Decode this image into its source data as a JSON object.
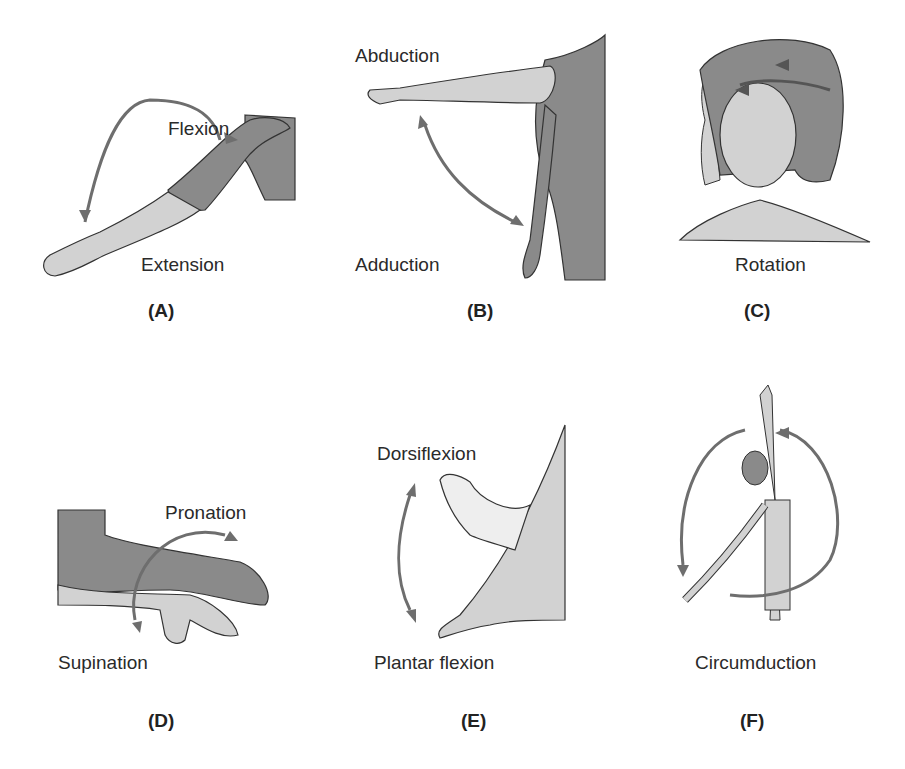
{
  "figure": {
    "colors": {
      "dark_limb": "#8a8a8a",
      "light_limb": "#d2d2d2",
      "outline": "#333333",
      "arrow": "#6e6e6e"
    },
    "panels": [
      {
        "id": "A",
        "caption": "(A)",
        "labels": [
          "Flexion",
          "Extension"
        ]
      },
      {
        "id": "B",
        "caption": "(B)",
        "labels": [
          "Abduction",
          "Adduction"
        ]
      },
      {
        "id": "C",
        "caption": "(C)",
        "labels": [
          "Rotation"
        ]
      },
      {
        "id": "D",
        "caption": "(D)",
        "labels": [
          "Pronation",
          "Supination"
        ]
      },
      {
        "id": "E",
        "caption": "(E)",
        "labels": [
          "Dorsiflexion",
          "Plantar flexion"
        ]
      },
      {
        "id": "F",
        "caption": "(F)",
        "labels": [
          "Circumduction"
        ]
      }
    ]
  }
}
